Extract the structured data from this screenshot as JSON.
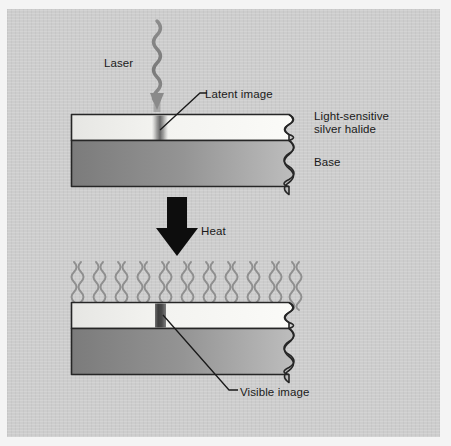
{
  "diagram": {
    "background_color": "#cdcdcd",
    "page_color": "#f4f4f4",
    "ink_color": "#1a1a1a",
    "labels": {
      "laser": "Laser",
      "latent_image": "Latent image",
      "silver_halide": "Light-sensitive\nsilver halide",
      "base": "Base",
      "heat": "Heat",
      "visible_image": "Visible image"
    },
    "stages": [
      {
        "name": "exposure",
        "caption": "Laser exposure creates a latent image",
        "layers": [
          {
            "name": "light-sensitive silver halide",
            "fill_from": "#e8e8e6",
            "fill_to": "#fbfbfa"
          },
          {
            "name": "base",
            "fill_from": "#7e7e7e",
            "fill_to": "#b9b9b9"
          }
        ],
        "marks": [
          {
            "name": "latent-image",
            "kind": "soft-blurred-bar",
            "color": "#575757"
          }
        ]
      },
      {
        "name": "development",
        "caption": "Heat develops the latent image into a visible image",
        "layers": [
          {
            "name": "light-sensitive silver halide",
            "fill_from": "#e8e8e6",
            "fill_to": "#fbfbfa"
          },
          {
            "name": "base",
            "fill_from": "#7e7e7e",
            "fill_to": "#b9b9b9"
          }
        ],
        "marks": [
          {
            "name": "visible-image",
            "kind": "solid-bar",
            "color": "#4a4a4a"
          }
        ]
      }
    ],
    "icons": {
      "laser_beam": "wavy-arrow-down-icon",
      "heat_arrow": "thick-block-arrow-down-icon",
      "heat_waves": "wavy-heat-lines-icon",
      "torn_edge": "torn-wavy-edge-icon"
    },
    "counts": {
      "heat_wave_columns": 11,
      "waves_per_column": 2
    }
  }
}
